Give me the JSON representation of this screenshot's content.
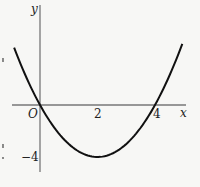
{
  "chart_data": {
    "type": "line",
    "title": "",
    "function": "y = x^2 - 4x",
    "xlabel": "x",
    "ylabel": "y",
    "origin_label": "O",
    "x_ticks": [
      {
        "value": 2,
        "label": "2"
      },
      {
        "value": 4,
        "label": "4"
      }
    ],
    "y_ticks": [
      {
        "value": -4,
        "label": "−4"
      }
    ],
    "key_points": [
      {
        "x": 0,
        "y": 0,
        "note": "root at origin"
      },
      {
        "x": 2,
        "y": -4,
        "note": "vertex (minimum)"
      },
      {
        "x": 4,
        "y": 0,
        "note": "root"
      }
    ],
    "series": [
      {
        "name": "parabola",
        "x": [
          -0.9,
          -0.5,
          0,
          0.5,
          1,
          1.5,
          2,
          2.5,
          3,
          3.5,
          4,
          4.5,
          4.95
        ],
        "y": [
          4.41,
          2.25,
          0,
          -1.75,
          -3,
          -3.75,
          -4,
          -3.75,
          -3,
          -1.75,
          0,
          2.25,
          4.7
        ]
      }
    ],
    "xlim": [
      -1,
      5.1
    ],
    "ylim": [
      -5,
      7.5
    ],
    "grid": false,
    "legend": null
  }
}
